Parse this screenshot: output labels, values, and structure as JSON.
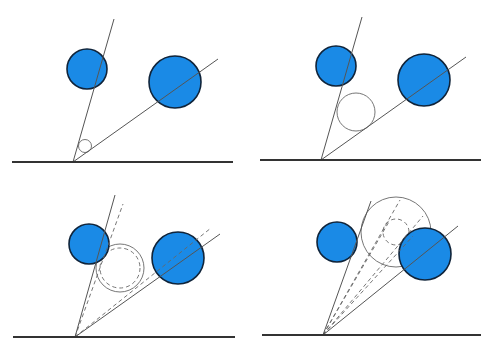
{
  "colors": {
    "background": "#ffffff",
    "ball_fill": "#1a8ae6",
    "ball_stroke": "#10243a",
    "ground": "#333333",
    "ray": "#555555",
    "construction": "#666666"
  },
  "panels": [
    {
      "id": "panel-1",
      "ground": {
        "x1": 12,
        "y1": 162,
        "x2": 233,
        "y2": 162
      },
      "apex": {
        "x": 73,
        "y": 162
      },
      "rays": [
        {
          "x2": 114,
          "y2": 19
        },
        {
          "x2": 218,
          "y2": 59
        }
      ],
      "dashed_rays": [],
      "balls": [
        {
          "cx": 87,
          "cy": 69,
          "r": 20
        },
        {
          "cx": 175,
          "cy": 82,
          "r": 26
        }
      ],
      "circles": [
        {
          "cx": 85,
          "cy": 146,
          "r": 6.5,
          "dashed": false
        }
      ]
    },
    {
      "id": "panel-2",
      "ground": {
        "x1": 260,
        "y1": 160,
        "x2": 481,
        "y2": 160
      },
      "apex": {
        "x": 321,
        "y": 160
      },
      "rays": [
        {
          "x2": 362,
          "y2": 17
        },
        {
          "x2": 466,
          "y2": 57
        }
      ],
      "dashed_rays": [],
      "balls": [
        {
          "cx": 336,
          "cy": 66,
          "r": 20
        },
        {
          "cx": 424,
          "cy": 80,
          "r": 26
        }
      ],
      "circles": [
        {
          "cx": 356,
          "cy": 112,
          "r": 19,
          "dashed": false
        }
      ]
    },
    {
      "id": "panel-3",
      "ground": {
        "x1": 13,
        "y1": 337,
        "x2": 235,
        "y2": 337
      },
      "apex": {
        "x": 75,
        "y": 337
      },
      "rays": [
        {
          "x2": 115,
          "y2": 195
        },
        {
          "x2": 220,
          "y2": 234
        }
      ],
      "dashed_rays": [
        {
          "x2": 123,
          "y2": 204
        },
        {
          "x2": 211,
          "y2": 228
        }
      ],
      "balls": [
        {
          "cx": 89,
          "cy": 244,
          "r": 20
        },
        {
          "cx": 178,
          "cy": 258,
          "r": 26
        }
      ],
      "circles": [
        {
          "cx": 120,
          "cy": 268,
          "r": 24,
          "dashed": false
        },
        {
          "cx": 120,
          "cy": 268,
          "r": 20,
          "dashed": true
        }
      ]
    },
    {
      "id": "panel-4",
      "ground": {
        "x1": 262,
        "y1": 335,
        "x2": 481,
        "y2": 335
      },
      "apex": {
        "x": 323,
        "y": 335
      },
      "rays": [
        {
          "x2": 371,
          "y2": 201
        },
        {
          "x2": 458,
          "y2": 226
        }
      ],
      "dashed_rays": [
        {
          "x2": 400,
          "y2": 200
        },
        {
          "x2": 423,
          "y2": 216
        },
        {
          "x2": 390,
          "y2": 220
        },
        {
          "x2": 413,
          "y2": 236
        }
      ],
      "balls": [
        {
          "cx": 337,
          "cy": 242,
          "r": 20
        },
        {
          "cx": 425,
          "cy": 254,
          "r": 26
        }
      ],
      "circles": [
        {
          "cx": 396,
          "cy": 232,
          "r": 35,
          "dashed": false
        },
        {
          "cx": 396,
          "cy": 232,
          "r": 13,
          "dashed": true
        }
      ]
    }
  ]
}
